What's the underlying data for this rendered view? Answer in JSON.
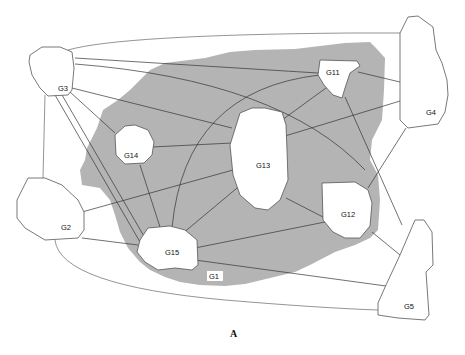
{
  "figure": {
    "caption": "A",
    "background_region_label": "G1",
    "nodes": [
      {
        "id": "G1",
        "label": "G1",
        "kind": "background"
      },
      {
        "id": "G2",
        "label": "G2",
        "kind": "outer"
      },
      {
        "id": "G3",
        "label": "G3",
        "kind": "outer"
      },
      {
        "id": "G4",
        "label": "G4",
        "kind": "outer"
      },
      {
        "id": "G5",
        "label": "G5",
        "kind": "outer"
      },
      {
        "id": "G11",
        "label": "G11",
        "kind": "inner"
      },
      {
        "id": "G12",
        "label": "G12",
        "kind": "inner"
      },
      {
        "id": "G13",
        "label": "G13",
        "kind": "inner"
      },
      {
        "id": "G14",
        "label": "G14",
        "kind": "inner"
      },
      {
        "id": "G15",
        "label": "G15",
        "kind": "inner"
      }
    ],
    "edges": [
      [
        "G3",
        "G4"
      ],
      [
        "G3",
        "G11"
      ],
      [
        "G3",
        "G12"
      ],
      [
        "G3",
        "G13"
      ],
      [
        "G3",
        "G14"
      ],
      [
        "G3",
        "G15"
      ],
      [
        "G3",
        "G2"
      ],
      [
        "G2",
        "G13"
      ],
      [
        "G2",
        "G15"
      ],
      [
        "G2",
        "G5"
      ],
      [
        "G14",
        "G13"
      ],
      [
        "G14",
        "G15"
      ],
      [
        "G11",
        "G13"
      ],
      [
        "G11",
        "G4"
      ],
      [
        "G11",
        "G5"
      ],
      [
        "G11",
        "G15"
      ],
      [
        "G13",
        "G12"
      ],
      [
        "G13",
        "G15"
      ],
      [
        "G13",
        "G4"
      ],
      [
        "G12",
        "G15"
      ],
      [
        "G12",
        "G4"
      ],
      [
        "G12",
        "G5"
      ],
      [
        "G15",
        "G5"
      ]
    ]
  }
}
